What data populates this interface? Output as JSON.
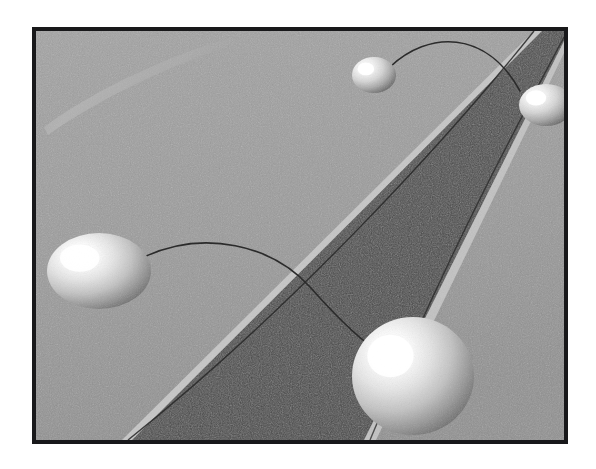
{
  "figure": {
    "caption": "",
    "frame": {
      "border_color": "#18181a",
      "border_width_px": 4,
      "x": 32,
      "y": 27,
      "width": 536,
      "height": 417
    },
    "page_background": "#ffffff"
  },
  "scene": {
    "background_plane": {
      "name": "ground-plane",
      "color": "#9b9b9b",
      "dither": true
    },
    "band": {
      "name": "dark-diagonal-band",
      "color": "#4c4c4c",
      "edge_highlight_color": "#c8c8c8",
      "edge_line_color": "#2a2a2a",
      "orientation": "diagonal from bottom-left to top-right",
      "left_edge": {
        "top_x": 498,
        "top_y": 0,
        "bottom_x": 96,
        "bottom_y": 409
      },
      "right_edge": {
        "top_x": 536,
        "top_y": 0,
        "bottom_x": 330,
        "bottom_y": 409
      }
    },
    "light_streak": {
      "name": "background-light-streak",
      "color": "#b4b4b4",
      "description": "faint pale arc in upper-left of background plane"
    },
    "spheres": [
      {
        "id": "sphere-small-top",
        "label": "Small sphere (top center)",
        "cx": 338,
        "cy": 44,
        "rx": 22,
        "ry": 18,
        "highlight_color": "#ffffff",
        "body_color": "#dcdcdc",
        "shadow_color": "#6e6e6e",
        "size_rank": 1
      },
      {
        "id": "sphere-right-edge",
        "label": "Sphere (right edge, clipped)",
        "cx": 510,
        "cy": 74,
        "rx": 27,
        "ry": 21,
        "highlight_color": "#ffffff",
        "body_color": "#dcdcdc",
        "shadow_color": "#6e6e6e",
        "size_rank": 2
      },
      {
        "id": "sphere-left-mid",
        "label": "Ellipsoid sphere (left middle)",
        "cx": 63,
        "cy": 240,
        "rx": 52,
        "ry": 38,
        "highlight_color": "#ffffff",
        "body_color": "#d4d4d4",
        "shadow_color": "#5e5e5e",
        "size_rank": 3
      },
      {
        "id": "sphere-bottom-right",
        "label": "Large sphere (bottom right)",
        "cx": 377,
        "cy": 345,
        "rx": 61,
        "ry": 59,
        "highlight_color": "#ffffff",
        "body_color": "#e2e2e2",
        "shadow_color": "#6a6a6a",
        "size_rank": 4
      }
    ],
    "trajectories": [
      {
        "id": "curve-top-arc",
        "label": "Arc from small top sphere to right-edge sphere",
        "color": "#2b2b2b",
        "width_px": 1.6,
        "from_sphere": "sphere-small-top",
        "to_sphere": "sphere-right-edge",
        "path": "M 358 38 C 392 2, 452 0, 487 62"
      },
      {
        "id": "curve-left-arc",
        "label": "Arc from left ellipsoid sphere across the band to the large sphere",
        "color": "#2b2b2b",
        "width_px": 1.6,
        "from_sphere": "sphere-left-mid",
        "to_sphere": "sphere-bottom-right",
        "path": "M 110 228 C 170 200, 238 216, 275 258 C 305 292, 326 312, 340 320"
      },
      {
        "id": "curve-band-left-edge-line",
        "label": "Thin dark line tracking the left edge of the band",
        "color": "#272727",
        "width_px": 1.4,
        "path": "M 486 0 C 400 110, 250 280, 86 409"
      },
      {
        "id": "curve-band-right-edge-line",
        "label": "Thin dark line descending along the right portion of the band",
        "color": "#272727",
        "width_px": 1.4,
        "path": "M 520 2 C 478 84, 410 212, 328 409"
      }
    ],
    "palette": {
      "white": "#ffffff",
      "light_gray": "#c8c8c8",
      "mid_gray": "#9b9b9b",
      "dark_gray": "#4c4c4c",
      "near_black": "#18181a"
    }
  }
}
